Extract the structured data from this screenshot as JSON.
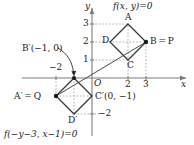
{
  "figure": {
    "title_top": "f(x, y)=0",
    "title_bottom": "f(−y−3, x−1)=0",
    "axis_x_label": "x",
    "axis_y_label": "y",
    "origin_label": "O",
    "colors": {
      "ink": "#1a1a1a",
      "axis": "#7d7d7d",
      "shape_stroke": "#3a3a3a",
      "dotted_guide": "#9a9a9a",
      "background": "#ffffff"
    },
    "axes": {
      "origin_px": {
        "x": 92,
        "y": 78
      },
      "unit_px": 18,
      "x_range": [
        -4,
        5.5
      ],
      "y_range": [
        -3.2,
        3.6
      ],
      "grid": false,
      "x_ticks": [
        {
          "label": "−2",
          "value": -2
        },
        {
          "label": "2",
          "value": 2
        },
        {
          "label": "3",
          "value": 3
        }
      ],
      "y_ticks": [
        {
          "label": "1",
          "value": 1
        },
        {
          "label": "2",
          "value": 2
        },
        {
          "label": "3",
          "value": 3
        },
        {
          "label": "−2",
          "value": -2
        }
      ]
    },
    "shapes": [
      {
        "name": "upper-diamond",
        "equation_label": "f(x, y)=0",
        "vertices": [
          {
            "id": "A",
            "label": "A",
            "x": 2,
            "y": 3,
            "dot": false,
            "label_pos": "above"
          },
          {
            "id": "B",
            "label": "B = P",
            "x": 3,
            "y": 2,
            "dot": true,
            "label_pos": "right"
          },
          {
            "id": "C",
            "label": "C",
            "x": 2,
            "y": 1,
            "dot": false,
            "label_pos": "below"
          },
          {
            "id": "D",
            "label": "D",
            "x": 1,
            "y": 2,
            "dot": false,
            "label_pos": "left"
          }
        ]
      },
      {
        "name": "lower-diamond",
        "equation_label": "f(−y−3, x−1)=0",
        "vertices": [
          {
            "id": "Bp",
            "label": "B′(−1, 0)",
            "x": -1,
            "y": 0,
            "dot": true,
            "label_pos": "callout"
          },
          {
            "id": "Cp",
            "label": "C′(0, −1)",
            "x": 0,
            "y": -1,
            "dot": false,
            "label_pos": "right"
          },
          {
            "id": "Dp",
            "label": "D′",
            "x": -1,
            "y": -2,
            "dot": false,
            "label_pos": "below"
          },
          {
            "id": "Ap",
            "label": "A′ = Q",
            "x": -2,
            "y": -1,
            "dot": true,
            "label_pos": "left"
          }
        ]
      }
    ],
    "connector_line": {
      "from": "Q",
      "to": "P",
      "x1": -2,
      "y1": -1,
      "x2": 3,
      "y2": 2,
      "style": "solid"
    },
    "labels": {
      "A": "A",
      "B": "B = P",
      "C": "C",
      "D": "D",
      "Ap": "A′ = Q",
      "Bp": "B′(−1, 0)",
      "Cp": "C′(0, −1)",
      "Dp": "D′",
      "tick_x_neg2": "−2",
      "tick_x_2": "2",
      "tick_x_3": "3",
      "tick_y_1": "1",
      "tick_y_2": "2",
      "tick_y_3": "3",
      "tick_y_neg2": "−2"
    }
  }
}
